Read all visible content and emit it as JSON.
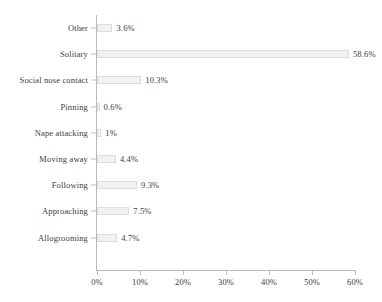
{
  "chart_data": {
    "type": "bar",
    "orientation": "horizontal",
    "title": "",
    "xlabel": "",
    "ylabel": "",
    "categories": [
      "Other",
      "Solitary",
      "Social nose contact",
      "Pinning",
      "Nape attacking",
      "Moving away",
      "Following",
      "Approaching",
      "Allogrooming"
    ],
    "values": [
      3.6,
      58.6,
      10.3,
      0.6,
      1,
      4.4,
      9.3,
      7.5,
      4.7
    ],
    "value_labels": [
      "3.6%",
      "58.6%",
      "10.3%",
      "0.6%",
      "1%",
      "4.4%",
      "9.3%",
      "7.5%",
      "4.7%"
    ],
    "xlim": [
      0,
      60
    ],
    "xticks": [
      0,
      10,
      20,
      30,
      40,
      50,
      60
    ],
    "xtick_labels": [
      "0%",
      "10%",
      "20%",
      "30%",
      "40%",
      "50%",
      "60%"
    ],
    "grid": false,
    "legend": null,
    "bar_fill": "#f1f1f1",
    "bar_border": "#dcdcdc",
    "axis_color": "#bdbdbd",
    "text_color": "#3d3d3d"
  }
}
